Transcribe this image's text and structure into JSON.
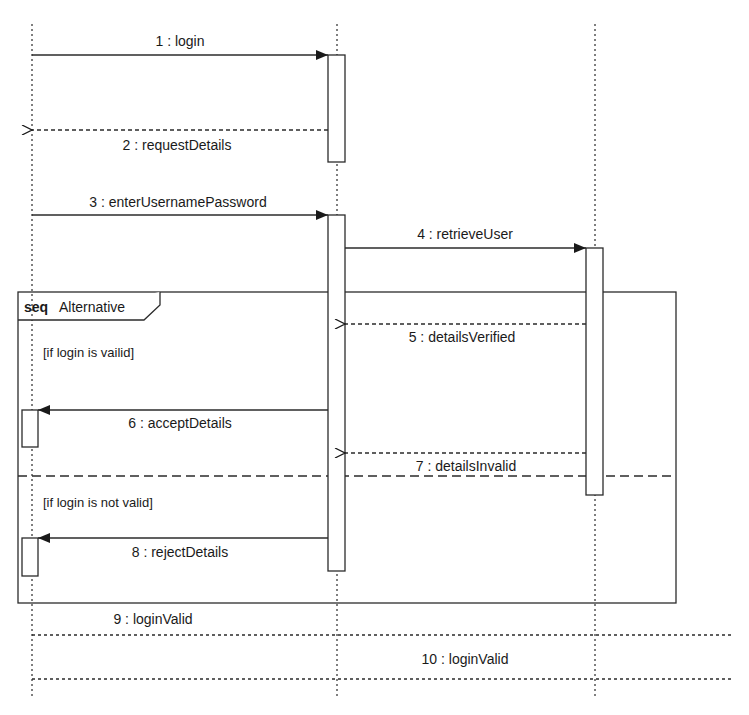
{
  "diagram": {
    "type": "sequence",
    "colors": {
      "line": "#2b2b2b",
      "background": "#ffffff",
      "text": "#1a1a1a"
    },
    "lifelines": [
      {
        "id": "left",
        "x": 32
      },
      {
        "id": "middle",
        "x": 337
      },
      {
        "id": "right",
        "x": 595
      }
    ],
    "messages": [
      {
        "label": "1 : login",
        "from": "left",
        "to": "middle",
        "kind": "sync"
      },
      {
        "label": "2 : requestDetails",
        "from": "middle",
        "to": "left",
        "kind": "reply"
      },
      {
        "label": "3 : enterUsernamePassword",
        "from": "left",
        "to": "middle",
        "kind": "sync"
      },
      {
        "label": "4 : retrieveUser",
        "from": "middle",
        "to": "right",
        "kind": "sync"
      },
      {
        "label": "5 : detailsVerified",
        "from": "right",
        "to": "middle",
        "kind": "reply"
      },
      {
        "label": "6 : acceptDetails",
        "from": "middle",
        "to": "left",
        "kind": "sync"
      },
      {
        "label": "7 : detailsInvalid",
        "from": "right",
        "to": "middle",
        "kind": "reply"
      },
      {
        "label": "8 : rejectDetails",
        "from": "middle",
        "to": "left",
        "kind": "sync"
      },
      {
        "label": "9 : loginValid",
        "from": "left",
        "to": "right-edge",
        "kind": "dotted"
      },
      {
        "label": "10 : loginValid",
        "from": "left",
        "to": "right-edge",
        "kind": "dotted"
      }
    ],
    "frame": {
      "keyword": "seq",
      "name": "Alternative",
      "operands": [
        {
          "guard": "[if login is vailid]"
        },
        {
          "guard": "[if login is not valid]"
        }
      ]
    }
  }
}
